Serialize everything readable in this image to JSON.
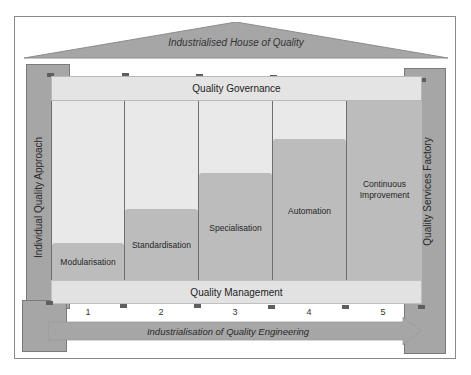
{
  "roof": {
    "title": "Industrialised House of Quality",
    "color": "#a6a6a6"
  },
  "pillars": {
    "left": {
      "label": "Individual Quality Approach",
      "color": "#a6a6a6"
    },
    "right": {
      "label": "Quality Services Factory",
      "color": "#a6a6a6"
    }
  },
  "governance": {
    "label": "Quality Governance"
  },
  "management": {
    "label": "Quality Management"
  },
  "columns": [
    {
      "label": "Modularisation",
      "number": "1",
      "bar_height_pct": 21
    },
    {
      "label": "Standardisation",
      "number": "2",
      "bar_height_pct": 40
    },
    {
      "label": "Specialisation",
      "number": "3",
      "bar_height_pct": 60
    },
    {
      "label": "Automation",
      "number": "4",
      "bar_height_pct": 79
    },
    {
      "label_line1": "Continuous",
      "label_line2": "Improvement",
      "number": "5",
      "bar_height_pct": 100
    }
  ],
  "arrow": {
    "label": "Industrialisation of Quality Engineering",
    "color": "#a6a6a6"
  },
  "colors": {
    "light_fill": "#e9e9e9",
    "bar_fill": "#bcbcbc",
    "divider": "#6e6e6e"
  }
}
